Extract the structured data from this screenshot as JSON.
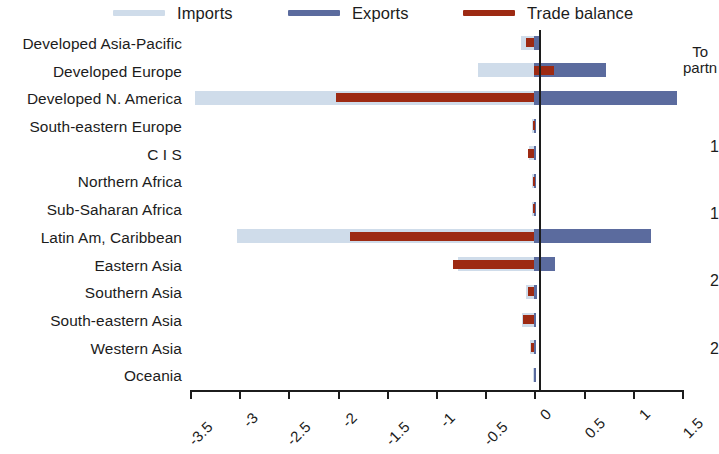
{
  "legend": {
    "items": [
      {
        "label": "Imports",
        "color": "#cfdcea",
        "name": "imports"
      },
      {
        "label": "Exports",
        "color": "#5b6b9e",
        "name": "exports"
      },
      {
        "label": "Trade balance",
        "color": "#9d2a13",
        "name": "trade-balance"
      }
    ]
  },
  "right_panel": {
    "title_line1": "To",
    "title_line2": "partn",
    "values": [
      "1",
      "1",
      "2",
      "2"
    ]
  },
  "chart_data": {
    "type": "bar",
    "orientation": "horizontal",
    "title": "",
    "subtitle": "",
    "xlabel": "",
    "ylabel": "",
    "xlim": [
      -3.5,
      1.5
    ],
    "xticks": [
      -3.5,
      -3,
      -2.5,
      -2,
      -1.5,
      -1,
      -0.5,
      0,
      0.5,
      1,
      1.5
    ],
    "xtick_labels": [
      "-3.5",
      "-3",
      "-2.5",
      "-2",
      "-1.5",
      "-1",
      "-0.5",
      "0",
      "0.5",
      "1",
      "1.5"
    ],
    "grid": false,
    "legend_position": "top",
    "zero_line": 0,
    "categories": [
      "Developed Asia-Pacific",
      "Developed Europe",
      "Developed N. America",
      "South-eastern Europe",
      "C I S",
      "Northern Africa",
      "Sub-Saharan Africa",
      "Latin Am, Caribbean",
      "Eastern Asia",
      "Southern Asia",
      "South-eastern Asia",
      "Western Asia",
      "Oceania"
    ],
    "series": [
      {
        "name": "Imports",
        "color": "#cfdcea",
        "values": [
          -0.14,
          -0.57,
          -3.45,
          -0.02,
          -0.05,
          -0.02,
          -0.02,
          -3.02,
          -0.78,
          -0.09,
          -0.13,
          -0.04,
          -0.01
        ]
      },
      {
        "name": "Exports",
        "color": "#5b6b9e",
        "values": [
          0.06,
          0.73,
          1.45,
          0.01,
          0.02,
          0.01,
          0.01,
          1.18,
          0.21,
          0.03,
          0.02,
          0.02,
          0.01
        ]
      },
      {
        "name": "Trade balance",
        "color": "#9d2a13",
        "values": [
          -0.09,
          0.2,
          -2.02,
          -0.01,
          -0.06,
          -0.01,
          -0.01,
          -1.87,
          -0.83,
          -0.06,
          -0.12,
          -0.03,
          0.0
        ]
      }
    ]
  }
}
